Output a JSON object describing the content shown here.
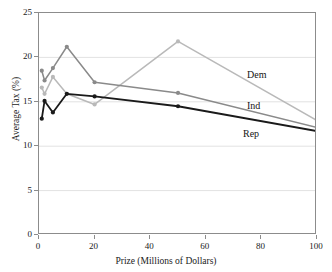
{
  "chart_data": {
    "type": "line",
    "title": "",
    "xlabel": "Prize (Millions of Dollars)",
    "ylabel": "Average Tax (%)",
    "xlim": [
      0,
      100
    ],
    "ylim": [
      0,
      25
    ],
    "xticks": [
      0,
      20,
      40,
      60,
      80,
      100
    ],
    "yticks": [
      0,
      5,
      10,
      15,
      20,
      25
    ],
    "grid": "horizontal",
    "legend_position": "inline-right",
    "series": [
      {
        "name": "Dem",
        "color": "#b9b9b9",
        "x": [
          1,
          2,
          5,
          10,
          20,
          50,
          100
        ],
        "values": [
          16.6,
          15.9,
          17.8,
          15.9,
          14.7,
          21.8,
          12.9
        ]
      },
      {
        "name": "Ind",
        "color": "#8a8a8a",
        "x": [
          1,
          2,
          5,
          10,
          20,
          50,
          100
        ],
        "values": [
          18.5,
          17.4,
          18.8,
          21.2,
          17.2,
          16.0,
          12.1
        ]
      },
      {
        "name": "Rep",
        "color": "#1a1a1a",
        "x": [
          1,
          2,
          5,
          10,
          20,
          50,
          100
        ],
        "values": [
          13.1,
          15.1,
          13.8,
          15.9,
          15.6,
          14.5,
          11.7
        ]
      }
    ],
    "annotations": [
      {
        "text": "Dem",
        "x_px": 247,
        "y_px": 70
      },
      {
        "text": "Ind",
        "x_px": 247,
        "y_px": 101
      },
      {
        "text": "Rep",
        "x_px": 243,
        "y_px": 129
      }
    ]
  }
}
